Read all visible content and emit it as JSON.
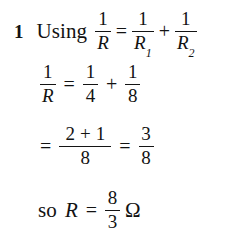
{
  "document": {
    "kind": "worked-solution",
    "subject_symbols": {
      "resistance": "R",
      "ohm": "Ω"
    },
    "background_color": "#ffffff",
    "text_color": "#121212"
  },
  "problem": {
    "item_number": "1",
    "lead_word": "Using"
  },
  "line1": {
    "lhs": {
      "num": "1",
      "den": "R"
    },
    "equals": "=",
    "term1": {
      "num": "1",
      "den": "R",
      "den_sub": "1"
    },
    "plus": "+",
    "term2": {
      "num": "1",
      "den": "R",
      "den_sub": "2"
    }
  },
  "line2": {
    "lhs": {
      "num": "1",
      "den": "R"
    },
    "equals": "=",
    "term1": {
      "num": "1",
      "den": "4"
    },
    "plus": "+",
    "term2": {
      "num": "1",
      "den": "8"
    }
  },
  "line3": {
    "equals1": "=",
    "term1": {
      "num_left": "2",
      "num_op": "+",
      "num_right": "1",
      "den": "8"
    },
    "equals2": "=",
    "term2": {
      "num": "3",
      "den": "8"
    }
  },
  "line4": {
    "prefix": "so",
    "variable": "R",
    "equals": "=",
    "value": {
      "num": "8",
      "den": "3"
    },
    "unit": "Ω"
  }
}
